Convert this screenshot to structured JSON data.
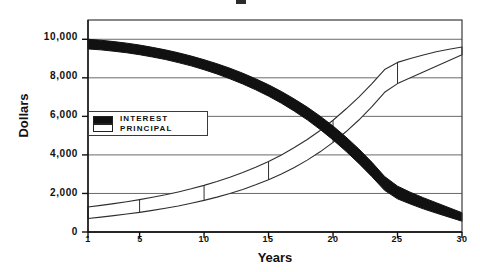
{
  "chart_data": {
    "type": "area",
    "title": "",
    "xlabel": "Years",
    "ylabel": "Dollars",
    "xlim": [
      1,
      30
    ],
    "ylim": [
      0,
      11000
    ],
    "grid": true,
    "legend_position": "inside-left",
    "x_ticks": [
      "1",
      "5",
      "10",
      "15",
      "20",
      "25",
      "30"
    ],
    "x_tick_values": [
      1,
      5,
      10,
      15,
      20,
      25,
      30
    ],
    "y_ticks": [
      "0",
      "2,000",
      "4,000",
      "6,000",
      "8,000",
      "10,000"
    ],
    "y_tick_values": [
      0,
      2000,
      4000,
      6000,
      8000,
      10000
    ],
    "x": [
      1,
      2,
      3,
      4,
      5,
      6,
      7,
      8,
      9,
      10,
      11,
      12,
      13,
      14,
      15,
      16,
      17,
      18,
      19,
      20,
      21,
      22,
      23,
      24,
      25,
      26,
      27,
      28,
      29,
      30
    ],
    "series": [
      {
        "name": "Interest",
        "swatch": "#111111",
        "values": [
          10000,
          9950,
          9880,
          9800,
          9700,
          9580,
          9450,
          9300,
          9130,
          8940,
          8730,
          8500,
          8240,
          7950,
          7640,
          7290,
          6900,
          6480,
          6010,
          5500,
          4930,
          4310,
          3630,
          2880,
          2380,
          2060,
          1780,
          1520,
          1260,
          1000
        ]
      },
      {
        "name": "Principal",
        "swatch": "#ffffff",
        "values": [
          1300,
          1380,
          1470,
          1570,
          1680,
          1800,
          1930,
          2080,
          2240,
          2420,
          2620,
          2840,
          3090,
          3360,
          3660,
          4000,
          4380,
          4800,
          5270,
          5800,
          6380,
          7000,
          7680,
          8430,
          8800,
          9000,
          9180,
          9350,
          9480,
          9600
        ]
      },
      {
        "name": "Principal lower edge",
        "swatch": "#ffffff",
        "values": [
          700,
          770,
          850,
          930,
          1020,
          1120,
          1230,
          1350,
          1490,
          1640,
          1810,
          2000,
          2210,
          2450,
          2710,
          3010,
          3350,
          3730,
          4160,
          4650,
          5200,
          5810,
          6490,
          7250,
          7700,
          8000,
          8300,
          8600,
          8900,
          9200
        ]
      },
      {
        "name": "Interest lower edge",
        "swatch": "#111111",
        "values": [
          9500,
          9450,
          9380,
          9300,
          9200,
          9080,
          8950,
          8790,
          8620,
          8420,
          8200,
          7950,
          7680,
          7380,
          7050,
          6680,
          6270,
          5820,
          5320,
          4780,
          4190,
          3560,
          2880,
          2160,
          1720,
          1450,
          1200,
          980,
          770,
          560
        ]
      }
    ],
    "legend": [
      {
        "label": "Interest",
        "swatch": "#111111"
      },
      {
        "label": "Principal",
        "swatch": "#ffffff"
      }
    ],
    "colors": {
      "interest_fill": "#111111",
      "principal_fill": "#ffffff",
      "axis": "#3a3a3a",
      "grid": "#6a6a6a",
      "text": "#111111",
      "background": "#ffffff"
    }
  }
}
